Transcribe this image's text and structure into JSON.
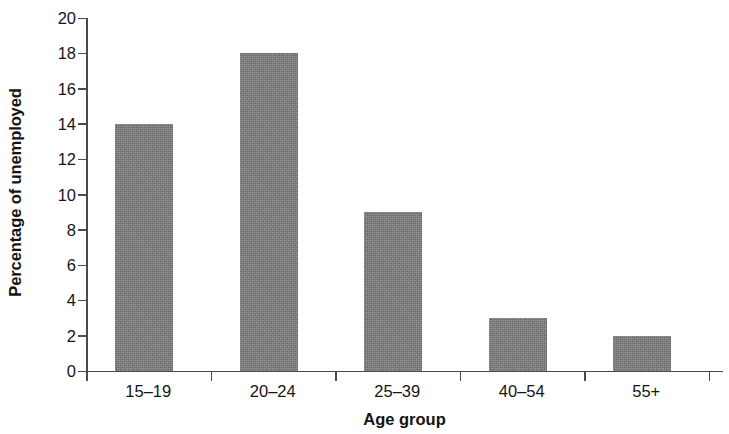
{
  "chart_data": {
    "type": "bar",
    "title": "",
    "subtitle": "",
    "xlabel": "Age group",
    "ylabel": "Percentage of unemployed",
    "categories": [
      "15–19",
      "20–24",
      "25–39",
      "40–54",
      "55+"
    ],
    "values": [
      14,
      18,
      9,
      3,
      2
    ],
    "series": [
      {
        "name": "Percentage of unemployed",
        "values": [
          14,
          18,
          9,
          3,
          2
        ]
      }
    ],
    "ylim": [
      0,
      20
    ],
    "ytick_labels": [
      "0",
      "2",
      "4",
      "6",
      "8",
      "10",
      "12",
      "14",
      "16",
      "18",
      "20"
    ],
    "ytick_values": [
      0,
      2,
      4,
      6,
      8,
      10,
      12,
      14,
      16,
      18,
      20
    ],
    "grid": false,
    "legend": false,
    "legend_position": "none",
    "bar_color": "#7d7d7d",
    "axis_color": "#4a4a4a",
    "background_color": "#ffffff",
    "text_color": "#151515"
  }
}
